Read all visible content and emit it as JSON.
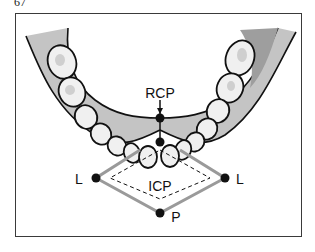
{
  "figure": {
    "number": "67",
    "labels": {
      "rcp": "RCP",
      "icp": "ICP",
      "left_lateral": "L",
      "right_lateral": "L",
      "protrusive": "P"
    },
    "colors": {
      "gum": "#bdbdbd",
      "gum_dark": "#9e9e9e",
      "tooth": "#f2f2f2",
      "outline": "#111111",
      "envelope": "#9a9a9a",
      "frame": "#3a3a3a"
    }
  }
}
